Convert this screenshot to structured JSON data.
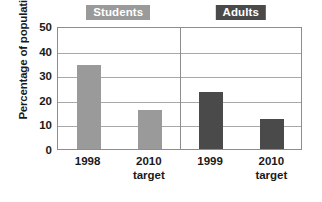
{
  "chart_data": {
    "type": "bar",
    "title": "",
    "subtitle": "",
    "xlabel": "",
    "ylabel": "Percentage of population",
    "ylim": [
      0,
      50
    ],
    "yticks": [
      0,
      10,
      20,
      30,
      40,
      50
    ],
    "ytick_labels": [
      "0",
      "10",
      "20",
      "30",
      "40",
      "50"
    ],
    "grid": true,
    "legend_position": "inside-top",
    "categories": [
      "1998",
      "2010 target",
      "1999",
      "2010 target"
    ],
    "values": [
      34,
      16,
      23,
      12
    ],
    "groups": [
      {
        "name": "Students",
        "color": "#9a9a9a",
        "badge_background": "#9a9a9a",
        "badge_text_color": "#ffffff",
        "bars": [
          {
            "label_line1": "1998",
            "label_line2": "",
            "value": 34
          },
          {
            "label_line1": "2010",
            "label_line2": "target",
            "value": 16
          }
        ]
      },
      {
        "name": "Adults",
        "color": "#4a4a4a",
        "badge_background": "#4a4a4a",
        "badge_text_color": "#ffffff",
        "bars": [
          {
            "label_line1": "1999",
            "label_line2": "",
            "value": 23
          },
          {
            "label_line1": "2010",
            "label_line2": "target",
            "value": 12
          }
        ]
      }
    ],
    "colors": {
      "students_bar": "#9a9a9a",
      "adults_bar": "#4a4a4a",
      "gridline": "#a8a8a8",
      "axis_frame": "#8d8d8d",
      "background": "#ffffff",
      "text": "#1a1a1a"
    }
  }
}
